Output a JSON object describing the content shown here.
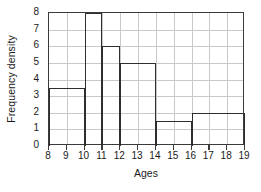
{
  "chart_data": {
    "type": "bar",
    "title": "",
    "subtitle": "",
    "xlabel": "Ages",
    "ylabel": "Frequency density",
    "xlim": [
      8,
      19
    ],
    "ylim": [
      0,
      8
    ],
    "grid": true,
    "legend": null,
    "x_ticks": [
      8,
      9,
      10,
      11,
      12,
      13,
      14,
      15,
      16,
      17,
      18,
      19
    ],
    "y_ticks": [
      0,
      1,
      2,
      3,
      4,
      5,
      6,
      7,
      8
    ],
    "x_tick_labels": [
      "8",
      "9",
      "10",
      "11",
      "12",
      "13",
      "14",
      "15",
      "16",
      "17",
      "18",
      "19"
    ],
    "y_tick_labels": [
      "0",
      "1",
      "2",
      "3",
      "4",
      "5",
      "6",
      "7",
      "8"
    ],
    "bin_edges": [
      8,
      10,
      11,
      12,
      14,
      16,
      19
    ],
    "categories": [
      "8-10",
      "10-11",
      "11-12",
      "12-14",
      "14-16",
      "16-19"
    ],
    "values": [
      3.5,
      8,
      6,
      5,
      1.5,
      2
    ],
    "bars": [
      {
        "label": "8-10",
        "start": 8,
        "end": 10,
        "value": 3.5
      },
      {
        "label": "10-11",
        "start": 10,
        "end": 11,
        "value": 8
      },
      {
        "label": "11-12",
        "start": 11,
        "end": 12,
        "value": 6
      },
      {
        "label": "12-14",
        "start": 12,
        "end": 14,
        "value": 5
      },
      {
        "label": "14-16",
        "start": 14,
        "end": 16,
        "value": 1.5
      },
      {
        "label": "16-19",
        "start": 16,
        "end": 19,
        "value": 2
      }
    ],
    "colors": {
      "bar_outline": "#2e2e2e",
      "bar_fill": "transparent",
      "grid": "#c9c9c9",
      "axis": "#3b3b3b",
      "text": "#1a1a1a",
      "background": "#ffffff"
    }
  }
}
